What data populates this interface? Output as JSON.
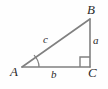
{
  "figure": {
    "type": "geometry-diagram",
    "background_color": "#fefefe",
    "stroke_color": "#808080",
    "label_color": "#2b2b2b",
    "vertices": [
      {
        "name": "A",
        "label": "A",
        "x": 22,
        "y": 67,
        "angle_marked": true
      },
      {
        "name": "B",
        "label": "B",
        "x": 90,
        "y": 19,
        "angle_marked": false
      },
      {
        "name": "C",
        "label": "C",
        "x": 90,
        "y": 67,
        "angle_marked": true,
        "right_angle": true
      }
    ],
    "sides": [
      {
        "name": "a",
        "label": "a",
        "from": "B",
        "to": "C",
        "orientation": "vertical"
      },
      {
        "name": "b",
        "label": "b",
        "from": "A",
        "to": "C",
        "orientation": "horizontal"
      },
      {
        "name": "c",
        "label": "c",
        "from": "A",
        "to": "B",
        "orientation": "hypotenuse"
      }
    ],
    "markers": {
      "right_angle_at": "C",
      "right_angle_size": 10,
      "angle_arc_at": "A",
      "angle_arc_radius": 17
    },
    "geometry": {
      "path_outline": "M 22 67 L 90 19 L 90 67 Z",
      "right_angle_path": "M 80 67 L 80 57 L 90 57",
      "arc_path": "M 39 67 A 17 17 0 0 0 34 55"
    }
  }
}
